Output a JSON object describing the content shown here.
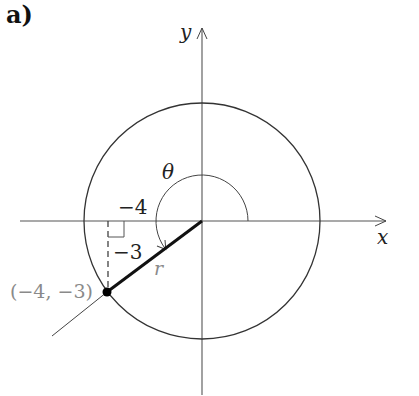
{
  "figure": {
    "part_label": "a)",
    "axes": {
      "x_label": "x",
      "y_label": "y"
    },
    "angle_label": "θ",
    "radius_label": "r",
    "horizontal_leg_label": "−4",
    "vertical_leg_label": "−3",
    "point_label": "(−4, −3)",
    "point": {
      "x": -4,
      "y": -3
    },
    "colors": {
      "ink": "#222222",
      "gray_label": "#8a8a8a"
    }
  }
}
